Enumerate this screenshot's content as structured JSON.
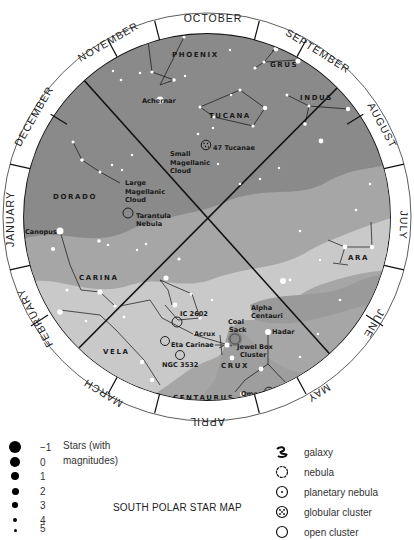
{
  "title": "SOUTH POLAR STAR MAP",
  "months": [
    "OCTOBER",
    "SEPTEMBER",
    "AUGUST",
    "JULY",
    "JUNE",
    "MAY",
    "APRIL",
    "MARCH",
    "FEBRUARY",
    "JANUARY",
    "DECEMBER",
    "NOVEMBER"
  ],
  "constellations": {
    "phoenix": "PHOENIX",
    "grus": "GRUS",
    "tucana": "TUCANA",
    "indus": "INDUS",
    "dorado": "DORADO",
    "carina": "CARINA",
    "vela": "VELA",
    "crux": "CRUX",
    "centaurus": "CENTAURUS",
    "ara": "ARA"
  },
  "objects": {
    "achernar": "Achernar",
    "tuc47": "47 Tucanae",
    "smc1": "Small",
    "smc2": "Magellanic",
    "smc3": "Cloud",
    "lmc1": "Large",
    "lmc2": "Magellanic",
    "lmc3": "Cloud",
    "tarantula1": "Tarantula",
    "tarantula2": "Nebula",
    "canopus": "Canopus",
    "ic2602": "IC 2602",
    "acrux": "Acrux",
    "eta_carinae": "Eta Carinae",
    "ngc3532": "NGC 3532",
    "coalsack1": "Coal",
    "coalsack2": "Sack",
    "alpha_cen1": "Alpha",
    "alpha_cen2": "Centauri",
    "hadar": "Hadar",
    "jewel1": "Jewel Box",
    "jewel2": "Cluster",
    "omega1": "Omega",
    "omega2": "Centauri"
  },
  "legend": {
    "magnitudes": [
      "−1",
      "0",
      "1",
      "2",
      "3",
      "4",
      "5"
    ],
    "stars_caption_1": "Stars (with",
    "stars_caption_2": "magnitudes)",
    "symbols": [
      {
        "icon": "galaxy-icon",
        "label": "galaxy"
      },
      {
        "icon": "nebula-icon",
        "label": "nebula"
      },
      {
        "icon": "planetary-nebula-icon",
        "label": "planetary nebula"
      },
      {
        "icon": "globular-cluster-icon",
        "label": "globular cluster"
      },
      {
        "icon": "open-cluster-icon",
        "label": "open cluster"
      }
    ]
  },
  "colors": {
    "sky_dark": "#8a8a8a",
    "milky_way_mid": "#a9a9a9",
    "milky_way_light": "#c8c8c8",
    "ring": "#ffffff",
    "lines": "#111111"
  }
}
